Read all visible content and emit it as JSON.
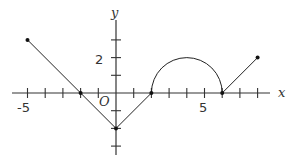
{
  "axes": {
    "x_label": "x",
    "y_label": "y",
    "origin_label": "O",
    "x_tick_labels": [
      {
        "value": -5,
        "text": "-5"
      },
      {
        "value": 5,
        "text": "5"
      }
    ],
    "y_tick_labels": [
      {
        "value": 2,
        "text": "2"
      }
    ],
    "x_ticks": [
      -5,
      -4,
      -3,
      -2,
      -1,
      1,
      2,
      3,
      4,
      5,
      6,
      7,
      8
    ],
    "y_ticks": [
      -3,
      -2,
      -1,
      1,
      2,
      3
    ]
  },
  "graph": {
    "segments": [
      {
        "from": [
          -5,
          3
        ],
        "to": [
          0,
          -2
        ]
      },
      {
        "from": [
          0,
          -2
        ],
        "to": [
          2,
          0
        ]
      },
      {
        "type": "semicircle",
        "center": [
          4,
          0
        ],
        "radius": 2
      },
      {
        "from": [
          6,
          0
        ],
        "to": [
          8,
          2
        ]
      }
    ],
    "points": [
      [
        -5,
        3
      ],
      [
        -2,
        0
      ],
      [
        0,
        -2
      ],
      [
        2,
        0
      ],
      [
        6,
        0
      ],
      [
        8,
        2
      ]
    ]
  },
  "colors": {
    "line": "#222222",
    "axis": "#333333"
  }
}
